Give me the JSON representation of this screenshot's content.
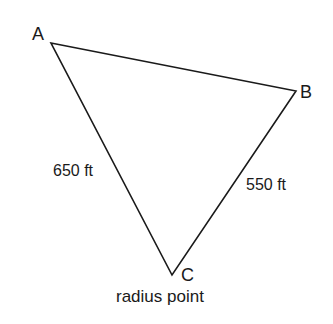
{
  "diagram": {
    "stroke_color": "#1a1a1a",
    "background": "#ffffff",
    "vertices": [
      {
        "id": "A",
        "label": "A",
        "x": 51,
        "y": 43
      },
      {
        "id": "B",
        "label": "B",
        "x": 296,
        "y": 91
      },
      {
        "id": "C",
        "label": "C",
        "x": 172,
        "y": 275
      }
    ],
    "edges": [
      {
        "from": "A",
        "to": "B",
        "label": ""
      },
      {
        "from": "A",
        "to": "C",
        "label": "650 ft"
      },
      {
        "from": "B",
        "to": "C",
        "label": "550 ft"
      }
    ],
    "labels": {
      "A": "A",
      "B": "B",
      "C": "C",
      "AC": "650 ft",
      "BC": "550 ft",
      "C_caption": "radius point"
    }
  }
}
